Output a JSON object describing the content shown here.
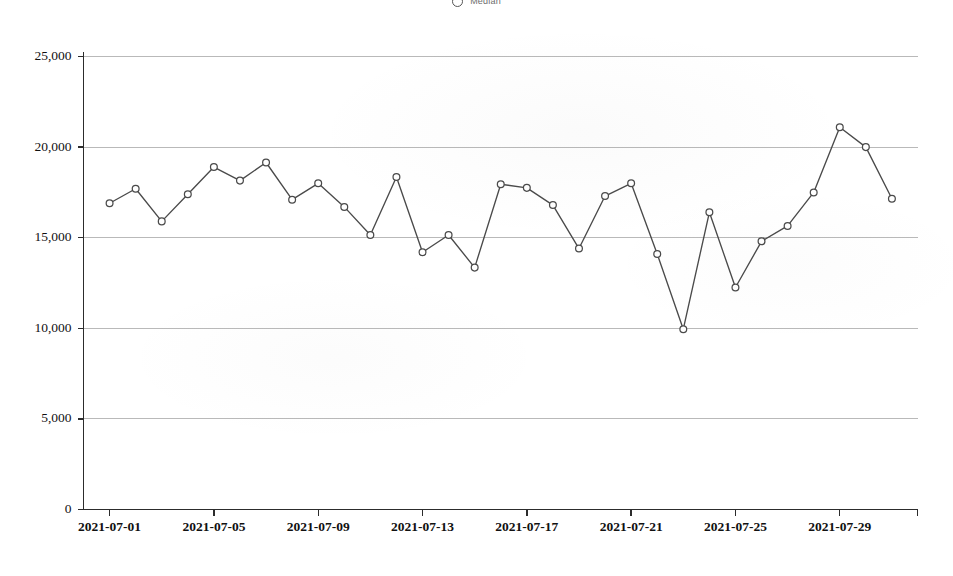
{
  "legend": {
    "label": "Median",
    "marker": "circle-open-marker",
    "position": "top-center"
  },
  "chart_data": {
    "type": "line",
    "title": "",
    "subtitle": "",
    "xlabel": "",
    "ylabel": "",
    "grid": true,
    "legend_position": "top-center",
    "ylim": [
      0,
      25000
    ],
    "yticks": [
      0,
      5000,
      10000,
      15000,
      20000,
      25000
    ],
    "ytick_labels": [
      "0",
      "5,000",
      "10,000",
      "15,000",
      "20,000",
      "25,000"
    ],
    "xtick_labels": [
      "2021-07-01",
      "2021-07-05",
      "2021-07-09",
      "2021-07-13",
      "2021-07-17",
      "2021-07-21",
      "2021-07-25",
      "2021-07-29"
    ],
    "xtick_indices": [
      0,
      4,
      8,
      12,
      16,
      20,
      24,
      28
    ],
    "x": [
      "2021-07-01",
      "2021-07-02",
      "2021-07-03",
      "2021-07-04",
      "2021-07-05",
      "2021-07-06",
      "2021-07-07",
      "2021-07-08",
      "2021-07-09",
      "2021-07-10",
      "2021-07-11",
      "2021-07-12",
      "2021-07-13",
      "2021-07-14",
      "2021-07-15",
      "2021-07-16",
      "2021-07-17",
      "2021-07-18",
      "2021-07-19",
      "2021-07-20",
      "2021-07-21",
      "2021-07-22",
      "2021-07-23",
      "2021-07-24",
      "2021-07-25",
      "2021-07-26",
      "2021-07-27",
      "2021-07-28",
      "2021-07-29",
      "2021-07-30",
      "2021-07-31"
    ],
    "series": [
      {
        "name": "Median",
        "color": "#4a4a4a",
        "marker": "circle-open",
        "values": [
          16900,
          17700,
          15900,
          17400,
          18900,
          18150,
          19150,
          17100,
          18000,
          16700,
          15150,
          18350,
          14200,
          15150,
          13350,
          17950,
          17750,
          16800,
          14400,
          17300,
          18000,
          14100,
          9950,
          16400,
          12250,
          14800,
          15650,
          17500,
          21100,
          20000,
          17150
        ]
      }
    ],
    "annotations": {
      "max_value": 21100,
      "max_date": "2021-07-29",
      "min_value": 9950,
      "min_date": "2021-07-23"
    }
  }
}
